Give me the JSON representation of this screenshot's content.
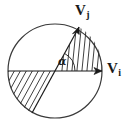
{
  "figure": {
    "name": "vector-angle-circle-diagram",
    "background_color": "#ffffff",
    "stroke_color": "#1a1a1a",
    "width": 129,
    "height": 128
  },
  "circle": {
    "name": "outer-circle",
    "center_x": 55,
    "center_y": 71,
    "radius": 47,
    "stroke_color": "#3a3a3a",
    "stroke_width": 1.2,
    "fill": "none"
  },
  "vectors": [
    {
      "id": "vi",
      "label_base": "V",
      "label_sub": "i",
      "description": "horizontal vector pointing right along the diameter",
      "from_x": 55,
      "from_y": 71,
      "to_x": 102,
      "to_y": 71,
      "angle_deg": 0,
      "arrowhead": true
    },
    {
      "id": "vj",
      "label_base": "V",
      "label_sub": "j",
      "description": "vector pointing up and to the right at angle alpha from Vi",
      "from_x": 55,
      "from_y": 71,
      "to_x": 79,
      "to_y": 27,
      "angle_deg": 61,
      "arrowhead": true
    }
  ],
  "angle_marker": {
    "name": "angle-alpha",
    "symbol": "α",
    "between": [
      "vi",
      "vj"
    ],
    "arc_radius": 20,
    "start_deg": 0,
    "end_deg": 61
  },
  "chords": [
    {
      "name": "vj-line-extended",
      "description": "line through the centre along the Vj direction continuing to the lower-left circle edge",
      "x1": 79,
      "y1": 27,
      "x2": 32,
      "y2": 113
    },
    {
      "name": "horizontal-diameter",
      "description": "horizontal diameter line through the centre",
      "x1": 8,
      "y1": 71,
      "x2": 102,
      "y2": 71
    }
  ],
  "hatched_regions": [
    {
      "name": "upper-right-sector-hatch",
      "description": "sector between Vi and Vj filled with near-vertical hatch lines",
      "hatch_angle_deg": 78,
      "hatch_spacing_px": 5
    },
    {
      "name": "lower-left-sector-hatch",
      "description": "opposite sector below the diameter filled with diagonal hatch lines",
      "hatch_angle_deg": 61,
      "hatch_spacing_px": 6
    }
  ],
  "labels": {
    "vj": {
      "base": "V",
      "sub": "j"
    },
    "vi": {
      "base": "V",
      "sub": "i"
    },
    "alpha": "α"
  }
}
